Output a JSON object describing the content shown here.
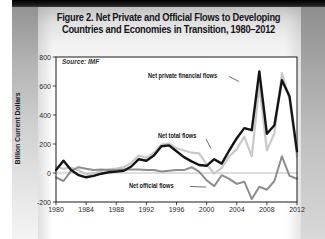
{
  "figure": {
    "title_line1": "Figure 2. Net Private and Official Flows to Developing",
    "title_line2": "Countries and Economies in Transition, 1980–2012",
    "source": "Source: IMF"
  },
  "chart_data": {
    "type": "line",
    "title": "Figure 2. Net Private and Official Flows to Developing Countries and Economies in Transition, 1980–2012",
    "source": "Source: IMF",
    "xlabel": "",
    "ylabel": "Billion Current Dollars",
    "ylim": [
      -200,
      800
    ],
    "y_ticks": [
      800,
      600,
      400,
      200,
      0,
      -200
    ],
    "x_ticks": [
      1980,
      1984,
      1988,
      1992,
      1996,
      2000,
      2004,
      2008,
      2012
    ],
    "grid": "zero-line-only",
    "legend_position": "inline-annotations",
    "x": [
      1980,
      1981,
      1982,
      1983,
      1984,
      1985,
      1986,
      1987,
      1988,
      1989,
      1990,
      1991,
      1992,
      1993,
      1994,
      1995,
      1996,
      1997,
      1998,
      1999,
      2000,
      2001,
      2002,
      2003,
      2004,
      2005,
      2006,
      2007,
      2008,
      2009,
      2010,
      2011,
      2012
    ],
    "series": [
      {
        "name": "Net private financial flows",
        "color": "#141414",
        "values": [
          20,
          85,
          20,
          -15,
          -30,
          -20,
          -5,
          5,
          10,
          15,
          45,
          95,
          85,
          120,
          185,
          190,
          150,
          110,
          80,
          55,
          50,
          95,
          65,
          155,
          240,
          310,
          295,
          700,
          270,
          330,
          640,
          530,
          150
        ]
      },
      {
        "name": "Net total flows",
        "color": "#c9c9c9",
        "values": [
          45,
          30,
          35,
          20,
          -10,
          -5,
          15,
          25,
          30,
          40,
          70,
          120,
          105,
          140,
          195,
          205,
          170,
          155,
          140,
          135,
          60,
          -5,
          35,
          115,
          165,
          250,
          115,
          605,
          155,
          275,
          690,
          510,
          110
        ]
      },
      {
        "name": "Net official flows",
        "color": "#8d8d8d",
        "values": [
          -30,
          -55,
          15,
          40,
          30,
          20,
          25,
          20,
          20,
          25,
          25,
          25,
          20,
          20,
          10,
          15,
          20,
          20,
          40,
          10,
          -50,
          -90,
          -15,
          -40,
          -75,
          -60,
          -180,
          -95,
          -115,
          -55,
          115,
          -20,
          -40
        ]
      }
    ],
    "colors": {
      "frame": "#1a1a1a",
      "zero_line": "#adadad",
      "plot_bg": "#ffffff"
    }
  }
}
